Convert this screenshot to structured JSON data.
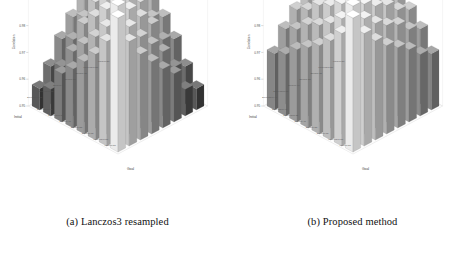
{
  "figure": {
    "panels": [
      {
        "id": "a",
        "caption": "(a) Lanczos3 resampled",
        "zaxis_label": "Correlation",
        "xaxis_label": "Initial",
        "yaxis_label": "Goal",
        "z_ticks": [
          "1",
          "0.99",
          "0.98",
          "0.97",
          "0.96",
          "0.95"
        ],
        "category_ticks": [
          "40x1x0.86",
          "40x0.63x0.86",
          "20x1x0.75",
          "20x1x0.53",
          "20x1x0.40",
          "20x0.63x0.75",
          "20x0.53x0.40"
        ]
      },
      {
        "id": "b",
        "caption": "(b) Proposed method",
        "zaxis_label": "Correlation",
        "xaxis_label": "Initial",
        "yaxis_label": "Goal",
        "z_ticks": [
          "1",
          "0.99",
          "0.98",
          "0.97",
          "0.96",
          "0.95"
        ],
        "category_ticks": [
          "40x1x0.86",
          "40x0.63x0.86",
          "20x1x0.75",
          "20x1x0.53",
          "20x1x0.40",
          "20x0.63x0.75",
          "20x0.53x0.40"
        ]
      }
    ]
  },
  "chart_data": [
    {
      "type": "bar",
      "id": "a",
      "title": "(a) Lanczos3 resampled",
      "xlabel": "Initial",
      "ylabel": "Goal",
      "zlabel": "Correlation",
      "zlim": [
        0.95,
        1.0
      ],
      "grid": true,
      "legend": "none",
      "categories": [
        "40x1x0.86",
        "40x0.63x0.86",
        "20x1x0.75",
        "20x1x0.53",
        "20x1x0.40",
        "20x0.63x0.75",
        "20x0.53x0.40",
        "20x0.53x0.33"
      ],
      "matrix": [
        [
          1.0,
          0.998,
          0.99,
          0.984,
          0.978,
          0.972,
          0.964,
          0.958
        ],
        [
          0.998,
          1.0,
          0.992,
          0.986,
          0.98,
          0.974,
          0.966,
          0.96
        ],
        [
          0.99,
          0.992,
          1.0,
          0.994,
          0.988,
          0.982,
          0.974,
          0.968
        ],
        [
          0.984,
          0.986,
          0.994,
          1.0,
          0.993,
          0.987,
          0.979,
          0.972
        ],
        [
          0.978,
          0.98,
          0.988,
          0.993,
          1.0,
          0.992,
          0.984,
          0.977
        ],
        [
          0.972,
          0.974,
          0.982,
          0.987,
          0.992,
          1.0,
          0.99,
          0.982
        ],
        [
          0.964,
          0.966,
          0.974,
          0.979,
          0.984,
          0.99,
          1.0,
          0.989
        ],
        [
          0.958,
          0.96,
          0.968,
          0.972,
          0.977,
          0.982,
          0.989,
          1.0
        ]
      ]
    },
    {
      "type": "bar",
      "id": "b",
      "title": "(b) Proposed method",
      "xlabel": "Initial",
      "ylabel": "Goal",
      "zlabel": "Correlation",
      "zlim": [
        0.95,
        1.0
      ],
      "grid": true,
      "legend": "none",
      "categories": [
        "40x1x0.86",
        "40x0.63x0.86",
        "20x1x0.75",
        "20x1x0.53",
        "20x1x0.40",
        "20x0.63x0.75",
        "20x0.53x0.40",
        "20x0.53x0.33"
      ],
      "matrix": [
        [
          1.0,
          0.996,
          0.993,
          0.99,
          0.987,
          0.983,
          0.978,
          0.971
        ],
        [
          0.996,
          1.0,
          0.995,
          0.992,
          0.989,
          0.985,
          0.98,
          0.973
        ],
        [
          0.993,
          0.995,
          1.0,
          0.996,
          0.993,
          0.989,
          0.984,
          0.977
        ],
        [
          0.99,
          0.992,
          0.996,
          1.0,
          0.995,
          0.991,
          0.986,
          0.98
        ],
        [
          0.987,
          0.989,
          0.993,
          0.995,
          1.0,
          0.994,
          0.989,
          0.983
        ],
        [
          0.983,
          0.985,
          0.989,
          0.991,
          0.994,
          1.0,
          0.993,
          0.987
        ],
        [
          0.978,
          0.98,
          0.984,
          0.986,
          0.989,
          0.993,
          1.0,
          0.992
        ],
        [
          0.971,
          0.973,
          0.977,
          0.98,
          0.983,
          0.987,
          0.992,
          1.0
        ]
      ]
    }
  ]
}
